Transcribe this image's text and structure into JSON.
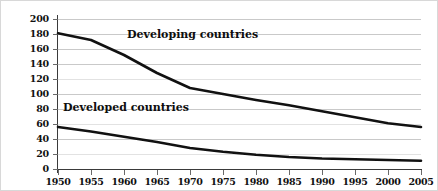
{
  "chart_data": {
    "type": "line",
    "title": "",
    "xlabel": "",
    "ylabel": "",
    "xlim": [
      1950,
      2005
    ],
    "ylim": [
      0,
      200
    ],
    "grid": true,
    "legend_position": "inline-annotation",
    "x": [
      1950,
      1955,
      1960,
      1965,
      1970,
      1975,
      1980,
      1985,
      1990,
      1995,
      2000,
      2005
    ],
    "xticklabels": [
      "1950",
      "1955",
      "1960",
      "1965",
      "1970",
      "1975",
      "1980",
      "1985",
      "1990",
      "1995",
      "2000",
      "2005"
    ],
    "yticks": [
      0,
      20,
      40,
      60,
      80,
      100,
      120,
      140,
      160,
      180,
      200
    ],
    "yticklabels": [
      "0",
      "20",
      "40",
      "60",
      "80",
      "100",
      "120",
      "140",
      "160",
      "180",
      "200"
    ],
    "series": [
      {
        "name": "Developing countries",
        "color": "#111111",
        "values": [
          181,
          172,
          152,
          128,
          108,
          100,
          92,
          85,
          77,
          69,
          61,
          56
        ]
      },
      {
        "name": "Developed countries",
        "color": "#111111",
        "values": [
          56,
          50,
          43,
          36,
          28,
          23,
          19,
          16,
          14,
          13,
          12,
          11
        ]
      }
    ],
    "annotations": [
      {
        "text": "Developing countries",
        "x": 1969,
        "y": 170
      },
      {
        "text": "Developed countries",
        "x": 1959,
        "y": 72
      }
    ]
  },
  "axis": {
    "y_labels": [
      "200",
      "180",
      "160",
      "140",
      "120",
      "100",
      "80",
      "60",
      "40",
      "20",
      "0"
    ],
    "x_labels": [
      "1950",
      "1955",
      "1960",
      "1965",
      "1970",
      "1975",
      "1980",
      "1985",
      "1990",
      "1995",
      "2000",
      "2005"
    ]
  },
  "labels": {
    "developing": "Developing countries",
    "developed": "Developed countries"
  }
}
